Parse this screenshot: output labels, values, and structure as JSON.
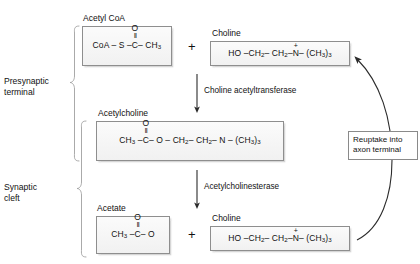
{
  "diagram": {
    "regions": [
      {
        "name": "presynaptic-terminal",
        "label_line1": "Presynaptic",
        "label_line2": "terminal"
      },
      {
        "name": "synaptic-cleft",
        "label_line1": "Synaptic",
        "label_line2": "cleft"
      }
    ],
    "molecules": {
      "acetyl_coa": {
        "caption": "Acetyl CoA",
        "formula_left": "CoA – S –",
        "carbonyl_o": "O",
        "carbonyl_bond": "‖",
        "carbonyl_c": "C",
        "formula_right": "– CH",
        "formula_right_sub": "3"
      },
      "choline_top": {
        "caption": "Choline",
        "seg1": "HO –CH",
        "seg1_sub": "2",
        "seg2": "– CH",
        "seg2_sub": "2",
        "seg3": "–",
        "nitrogen": "N",
        "charge": "+",
        "seg4": "– (CH",
        "seg4_sub": "3",
        "seg5": ")",
        "seg5_sub": "3"
      },
      "acetylcholine": {
        "caption": "Acetylcholine",
        "formula_left": "CH",
        "formula_left_sub": "3",
        "formula_left2": " –",
        "carbonyl_o": "O",
        "carbonyl_bond": "‖",
        "carbonyl_c": "C",
        "seg_a": "– O – CH",
        "seg_a_sub": "2",
        "seg_b": "– CH",
        "seg_b_sub": "2",
        "seg_c": "– N – (CH",
        "seg_c_sub": "3",
        "seg_d": ")",
        "seg_d_sub": "3"
      },
      "acetate": {
        "caption": "Acetate",
        "formula_left": "CH",
        "formula_left_sub": "3",
        "formula_left2": " –",
        "carbonyl_o": "O",
        "carbonyl_bond": "‖",
        "carbonyl_c": "C",
        "formula_right": "– O"
      },
      "choline_bottom": {
        "caption": "Choline",
        "seg1": "HO –CH",
        "seg1_sub": "2",
        "seg2": "– CH",
        "seg2_sub": "2",
        "seg3": "–",
        "nitrogen": "N",
        "charge": "+",
        "seg4": "– (CH",
        "seg4_sub": "3",
        "seg5": ")",
        "seg5_sub": "3"
      }
    },
    "operators": {
      "plus_top": "+",
      "plus_bottom": "+"
    },
    "enzymes": [
      {
        "name": "choline-acetyltransferase",
        "label": "Choline acetyltransferase"
      },
      {
        "name": "acetylcholinesterase",
        "label": "Acetylcholinesterase"
      }
    ],
    "callout": {
      "line1": "Reuptake into",
      "line2": "axon terminal"
    },
    "colors": {
      "box_border": "#8e8e8e",
      "box_fill": "#f4f4f4",
      "text": "#111111",
      "arrow": "#2b2b2b",
      "bracket": "#9a9a9a",
      "background": "#ffffff"
    }
  }
}
